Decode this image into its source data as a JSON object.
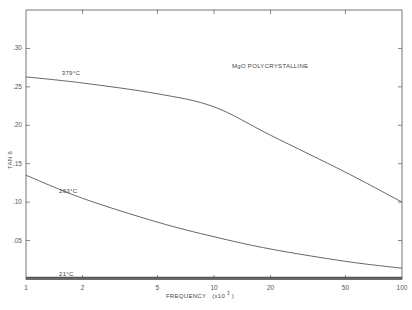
{
  "chart_data": {
    "type": "line",
    "title": "MgO POLYCRYSTALLINE",
    "xlabel": "FREQUENCY (x10^3)",
    "xlabel_main": "FREQUENCY",
    "xlabel_unit": "(x10",
    "xlabel_exp": "3",
    "xlabel_close": ")",
    "ylabel": "TAN δ",
    "x_scale": "log",
    "xlim": [
      1,
      100
    ],
    "ylim": [
      0,
      0.35
    ],
    "grid": false,
    "x_ticks": [
      {
        "value": 1,
        "label": "1"
      },
      {
        "value": 2,
        "label": "2"
      },
      {
        "value": 5,
        "label": "5"
      },
      {
        "value": 10,
        "label": "10"
      },
      {
        "value": 20,
        "label": "20"
      },
      {
        "value": 50,
        "label": "50"
      },
      {
        "value": 100,
        "label": "100"
      }
    ],
    "y_ticks": [
      {
        "value": 0.05,
        "label": ".05"
      },
      {
        "value": 0.1,
        "label": ".10"
      },
      {
        "value": 0.15,
        "label": ".15"
      },
      {
        "value": 0.2,
        "label": ".20"
      },
      {
        "value": 0.25,
        "label": ".25"
      },
      {
        "value": 0.3,
        "label": ".30"
      }
    ],
    "series": [
      {
        "name": "379°C",
        "label_at": {
          "x": 1.55,
          "y": 0.266
        },
        "x": [
          1,
          2,
          5,
          10,
          20,
          50,
          100
        ],
        "values": [
          0.263,
          0.255,
          0.241,
          0.224,
          0.187,
          0.139,
          0.1
        ]
      },
      {
        "name": "263°C",
        "label_at": {
          "x": 1.5,
          "y": 0.112
        },
        "x": [
          1,
          2,
          5,
          10,
          20,
          50,
          100
        ],
        "values": [
          0.135,
          0.105,
          0.074,
          0.055,
          0.039,
          0.023,
          0.014
        ]
      },
      {
        "name": "21°C",
        "label_at": {
          "x": 1.5,
          "y": 0.004
        },
        "x": [
          1,
          2,
          5,
          10,
          20,
          50,
          100
        ],
        "values": [
          0.002,
          0.002,
          0.002,
          0.002,
          0.002,
          0.002,
          0.002
        ]
      }
    ]
  }
}
